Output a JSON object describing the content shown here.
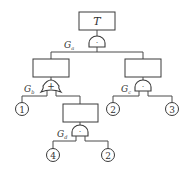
{
  "diagram": {
    "type": "fault-tree",
    "top_event": {
      "label": "T"
    },
    "gates": [
      {
        "id": "Ga",
        "label": "G",
        "sub": "a",
        "symbol": "·",
        "type": "AND"
      },
      {
        "id": "Gb",
        "label": "G",
        "sub": "b",
        "symbol": "+",
        "type": "OR"
      },
      {
        "id": "Gc",
        "label": "G",
        "sub": "c",
        "symbol": "·",
        "type": "AND"
      },
      {
        "id": "Gd",
        "label": "G",
        "sub": "d",
        "symbol": "·",
        "type": "AND"
      }
    ],
    "basic_events": [
      {
        "label": "1"
      },
      {
        "label": "2"
      },
      {
        "label": "3"
      },
      {
        "label": "4"
      },
      {
        "label": "2"
      }
    ]
  }
}
